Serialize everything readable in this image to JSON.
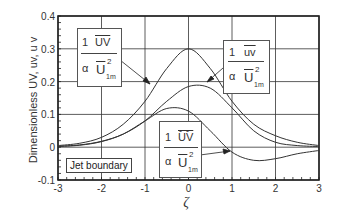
{
  "chart_data": {
    "type": "line",
    "title": "",
    "xlabel": "ζ",
    "ylabel": "Dimensionless UV, uv, ūv̄",
    "xlim": [
      -3,
      3
    ],
    "ylim": [
      -0.1,
      0.4
    ],
    "xticks": [
      "-3",
      "-2",
      "-1",
      "0",
      "1",
      "2",
      "3"
    ],
    "yticks": [
      "-0.1",
      "0",
      "0.1",
      "0.2",
      "0.3",
      "0.4"
    ],
    "grid": true,
    "x": [
      -3,
      -2.5,
      -2,
      -1.5,
      -1,
      -0.5,
      0,
      0.5,
      1,
      1.5,
      2,
      2.5,
      3
    ],
    "series": [
      {
        "name": "(1/α) UV / U1m²",
        "values": [
          0.005,
          0.012,
          0.03,
          0.07,
          0.14,
          0.24,
          0.3,
          0.24,
          0.14,
          0.07,
          0.035,
          0.015,
          0.005
        ]
      },
      {
        "name": "(1/α) uv / U1m²",
        "values": [
          0.003,
          0.007,
          0.018,
          0.04,
          0.08,
          0.14,
          0.185,
          0.18,
          0.12,
          0.05,
          0.015,
          0.005,
          0.002
        ]
      },
      {
        "name": "(1/α) ŪV̄ / U1m²",
        "values": [
          0.002,
          0.006,
          0.017,
          0.04,
          0.08,
          0.118,
          0.11,
          0.05,
          -0.015,
          -0.04,
          -0.035,
          -0.02,
          -0.01
        ]
      }
    ],
    "annotations": [
      {
        "text": "1/α · UV̄ / Ū1m²",
        "target_series": 0
      },
      {
        "text": "1/α · ūv̄ / Ū1m²",
        "target_series": 1
      },
      {
        "text": "1/α · ŪV̈ / Ū1m²",
        "target_series": 2
      },
      {
        "text": "Jet boundary"
      }
    ]
  },
  "labels": {
    "box1": {
      "one": "1",
      "num": "UV",
      "alpha": "α",
      "den": "U",
      "sup": "2",
      "sub": "1m"
    },
    "box2": {
      "one": "1",
      "num": "uv",
      "alpha": "α",
      "den": "U",
      "sup": "2",
      "sub": "1m"
    },
    "box3": {
      "one": "1",
      "num": "UV",
      "alpha": "α",
      "den": "U",
      "sup": "2",
      "sub": "1m"
    },
    "jet_boundary": "Jet boundary",
    "ylabel": "Dimensionless UV, uv, u v",
    "xlabel": "ζ"
  }
}
